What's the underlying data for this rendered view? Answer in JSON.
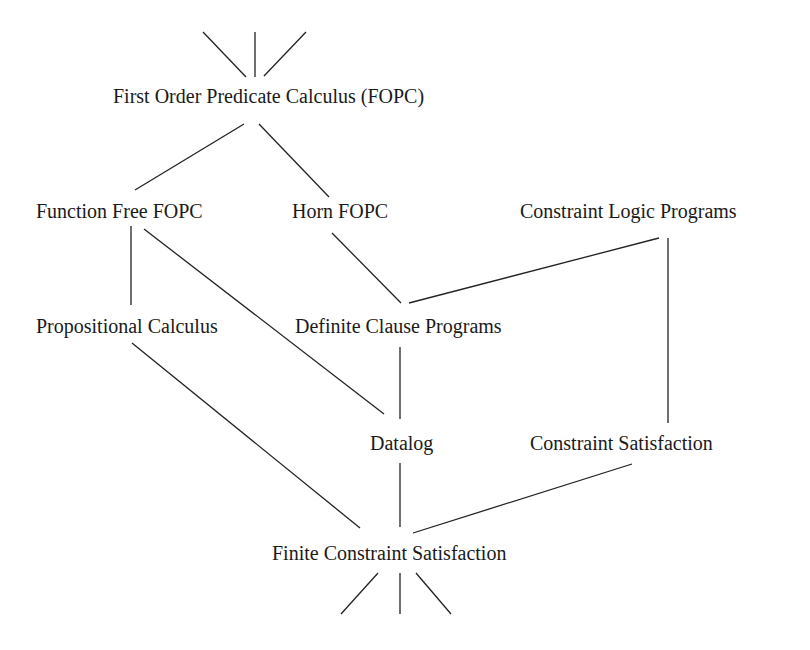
{
  "diagram": {
    "type": "hierarchy-lattice",
    "line_color": "#222222",
    "text_color": "#1a1a1a",
    "nodes": [
      {
        "id": "fopc",
        "label": "First Order Predicate Calculus (FOPC)",
        "x": 113,
        "y": 86
      },
      {
        "id": "fffopc",
        "label": "Function Free FOPC",
        "x": 36,
        "y": 201
      },
      {
        "id": "horn",
        "label": "Horn FOPC",
        "x": 292,
        "y": 201
      },
      {
        "id": "clp",
        "label": "Constraint Logic Programs",
        "x": 520,
        "y": 201
      },
      {
        "id": "prop",
        "label": "Propositional Calculus",
        "x": 36,
        "y": 316
      },
      {
        "id": "dcp",
        "label": "Definite Clause Programs",
        "x": 295,
        "y": 316
      },
      {
        "id": "datalog",
        "label": "Datalog",
        "x": 370,
        "y": 433
      },
      {
        "id": "cs",
        "label": "Constraint Satisfaction",
        "x": 530,
        "y": 433
      },
      {
        "id": "fcs",
        "label": "Finite Constraint Satisfaction",
        "x": 272,
        "y": 543
      }
    ],
    "edges": [
      {
        "from": "above",
        "to": "fopc",
        "x1": 203,
        "y1": 32,
        "x2": 246,
        "y2": 77
      },
      {
        "from": "above",
        "to": "fopc",
        "x1": 255,
        "y1": 32,
        "x2": 255,
        "y2": 77
      },
      {
        "from": "above",
        "to": "fopc",
        "x1": 306,
        "y1": 32,
        "x2": 264,
        "y2": 76
      },
      {
        "from": "fopc",
        "to": "fffopc",
        "x1": 244,
        "y1": 124,
        "x2": 135,
        "y2": 190
      },
      {
        "from": "fopc",
        "to": "horn",
        "x1": 259,
        "y1": 124,
        "x2": 329,
        "y2": 197
      },
      {
        "from": "fffopc",
        "to": "prop",
        "x1": 131,
        "y1": 226,
        "x2": 131,
        "y2": 305
      },
      {
        "from": "fffopc",
        "to": "datalog",
        "x1": 144,
        "y1": 229,
        "x2": 384,
        "y2": 414
      },
      {
        "from": "horn",
        "to": "dcp",
        "x1": 332,
        "y1": 233,
        "x2": 401,
        "y2": 303
      },
      {
        "from": "clp",
        "to": "dcp",
        "x1": 659,
        "y1": 238,
        "x2": 409,
        "y2": 303
      },
      {
        "from": "clp",
        "to": "cs",
        "x1": 668,
        "y1": 238,
        "x2": 668,
        "y2": 423
      },
      {
        "from": "dcp",
        "to": "datalog",
        "x1": 400,
        "y1": 347,
        "x2": 400,
        "y2": 419
      },
      {
        "from": "prop",
        "to": "fcs",
        "x1": 132,
        "y1": 343,
        "x2": 360,
        "y2": 528
      },
      {
        "from": "datalog",
        "to": "fcs",
        "x1": 400,
        "y1": 463,
        "x2": 400,
        "y2": 527
      },
      {
        "from": "cs",
        "to": "fcs",
        "x1": 632,
        "y1": 464,
        "x2": 413,
        "y2": 533
      },
      {
        "from": "fcs",
        "to": "below",
        "x1": 378,
        "y1": 573,
        "x2": 341,
        "y2": 614
      },
      {
        "from": "fcs",
        "to": "below",
        "x1": 400,
        "y1": 573,
        "x2": 400,
        "y2": 614
      },
      {
        "from": "fcs",
        "to": "below",
        "x1": 416,
        "y1": 573,
        "x2": 451,
        "y2": 614
      }
    ]
  }
}
